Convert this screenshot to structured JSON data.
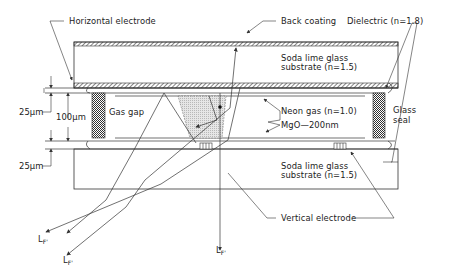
{
  "labels": {
    "horizontal_electrode": "Horizontal electrode",
    "back_coating": "Back coating",
    "dielectric": "Dielectric (n=1.8)",
    "top_substrate_line1": "Soda lime glass",
    "top_substrate_line2": "substrate (n=1.5)",
    "gas_gap": "Gas gap",
    "neon_gas": "Neon gas (n=1.0)",
    "mgo": "MgO—200nm",
    "glass_seal_line1": "Glass",
    "glass_seal_line2": "seal",
    "bottom_substrate_line1": "Soda lime glass",
    "bottom_substrate_line2": "substrate (n=1.5)",
    "vertical_electrode": "Vertical electrode",
    "dim_25_top": "25μm",
    "dim_100": "100μm",
    "dim_25_bottom": "25μm",
    "lf_main": "L",
    "lf_sub": "F'"
  },
  "colors": {
    "line": "#333333",
    "shade": "#d8d8d8",
    "seal": "#555555"
  }
}
